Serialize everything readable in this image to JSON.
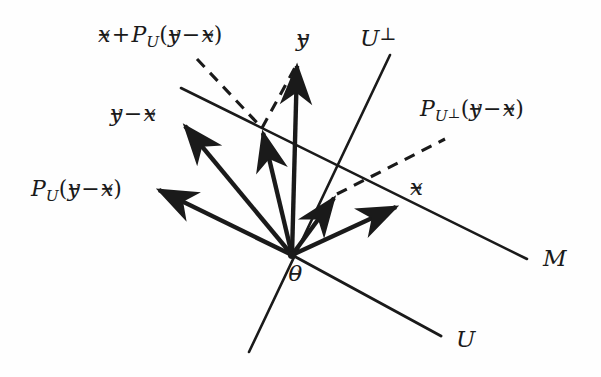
{
  "figure": {
    "background_color": "#fefefe",
    "ink_color": "#1a1a1a",
    "width": 601,
    "height": 377
  },
  "labels": {
    "x_plus_proj": {
      "text": "x + P_U(y - x)",
      "parts": {
        "vec_x": "x",
        "plus": "+",
        "P": "P",
        "sub_U": "U",
        "open": "(",
        "vec_y": "y",
        "minus": "−",
        "vec_x2": "x",
        "close": ")"
      }
    },
    "y_minus_x": {
      "text": "y - x",
      "parts": {
        "vec_y": "y",
        "minus": "−",
        "vec_x": "x"
      }
    },
    "proj_U": {
      "text": "P_U(y - x)",
      "parts": {
        "P": "P",
        "sub_U": "U",
        "open": "(",
        "vec_y": "y",
        "minus": "−",
        "vec_x": "x",
        "close": ")"
      }
    },
    "proj_Uperp": {
      "text": "P_{U⊥}(y - x)",
      "parts": {
        "P": "P",
        "sub_U": "U",
        "sub_perp": "⊥",
        "open": "(",
        "vec_y": "y",
        "minus": "−",
        "vec_x": "x",
        "close": ")"
      }
    },
    "vec_y": {
      "text": "y"
    },
    "vec_x": {
      "text": "x"
    },
    "vec_zero": {
      "text": "0"
    },
    "U_perp": {
      "text": "U",
      "perp": "⊥"
    },
    "M": {
      "text": "M"
    },
    "U": {
      "text": "U"
    }
  },
  "geometry": {
    "origin": {
      "x": 292,
      "y": 255
    },
    "vectors": [
      {
        "name": "vec-y",
        "x1": 292,
        "y1": 255,
        "x2": 297,
        "y2": 62
      },
      {
        "name": "vec-y-minus-x",
        "x1": 292,
        "y1": 255,
        "x2": 181,
        "y2": 122
      },
      {
        "name": "vec-x-plus-proj",
        "x1": 292,
        "y1": 255,
        "x2": 261,
        "y2": 128
      },
      {
        "name": "vec-proj-U",
        "x1": 292,
        "y1": 255,
        "x2": 153,
        "y2": 188
      },
      {
        "name": "vec-proj-Uperp",
        "x1": 292,
        "y1": 255,
        "x2": 337,
        "y2": 194
      },
      {
        "name": "vec-x",
        "x1": 292,
        "y1": 255,
        "x2": 401,
        "y2": 204
      }
    ],
    "lines": [
      {
        "name": "line-M",
        "x1": 181,
        "y1": 88,
        "x2": 527,
        "y2": 259
      },
      {
        "name": "line-U-perp",
        "x1": 390,
        "y1": 55,
        "x2": 249,
        "y2": 352
      },
      {
        "name": "line-U",
        "x1": 292,
        "y1": 255,
        "x2": 441,
        "y2": 336
      }
    ],
    "dashed": [
      {
        "name": "dash-x-to-foot",
        "x1": 197,
        "y1": 59,
        "x2": 262,
        "y2": 128
      },
      {
        "name": "dash-foot-to-y",
        "x1": 262,
        "y1": 128,
        "x2": 297,
        "y2": 64
      },
      {
        "name": "dash-proj-perp",
        "x1": 337,
        "y1": 194,
        "x2": 445,
        "y2": 139
      }
    ]
  }
}
